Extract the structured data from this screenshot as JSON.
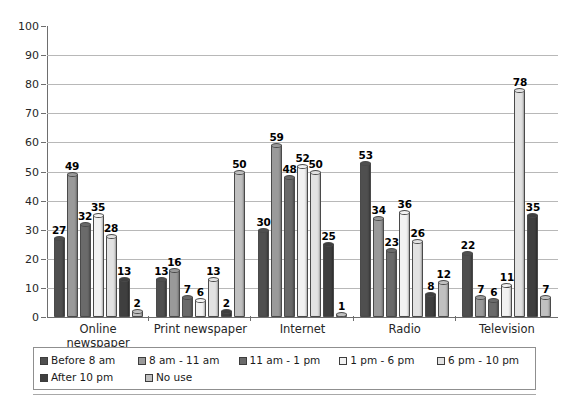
{
  "chart_data": {
    "type": "bar",
    "title": "",
    "xlabel": "",
    "ylabel": "",
    "ylim": [
      0,
      100
    ],
    "yticks": [
      0,
      10,
      20,
      30,
      40,
      50,
      60,
      70,
      80,
      90,
      100
    ],
    "grid": true,
    "legend_position": "bottom",
    "categories": [
      "Online newspaper",
      "Print newspaper",
      "Internet",
      "Radio",
      "Television"
    ],
    "series": [
      {
        "name": "Before 8 am",
        "color": "#4f4f4f",
        "values": [
          27,
          13,
          30,
          53,
          22
        ]
      },
      {
        "name": "8 am - 11 am",
        "color": "#9a9a9a",
        "values": [
          49,
          16,
          59,
          34,
          7
        ]
      },
      {
        "name": "11 am - 1 pm",
        "color": "#6a6a6a",
        "values": [
          32,
          7,
          48,
          23,
          6
        ]
      },
      {
        "name": "1 pm - 6 pm",
        "color": "#f2f2f2",
        "values": [
          35,
          6,
          52,
          36,
          11
        ]
      },
      {
        "name": "6 pm - 10 pm",
        "color": "#e2e2e2",
        "values": [
          28,
          13,
          50,
          26,
          78
        ]
      },
      {
        "name": "After 10 pm",
        "color": "#3f3f3f",
        "values": [
          13,
          2,
          25,
          8,
          35
        ]
      },
      {
        "name": "No use",
        "color": "#c0c0c0",
        "values": [
          2,
          50,
          1,
          12,
          7
        ]
      }
    ]
  },
  "axis": {
    "y_tick_labels": [
      "0",
      "10",
      "20",
      "30",
      "40",
      "50",
      "60",
      "70",
      "80",
      "90",
      "100"
    ]
  }
}
